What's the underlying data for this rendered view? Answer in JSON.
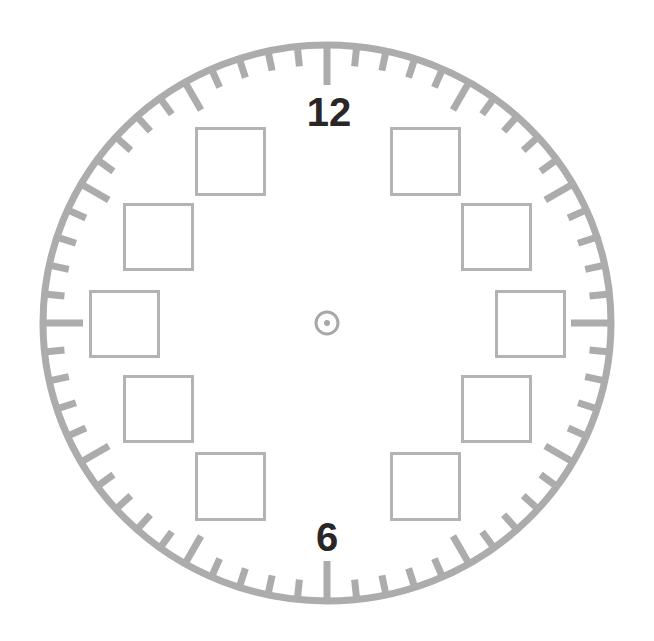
{
  "clock_face": {
    "center": {
      "x": 327,
      "y": 323
    },
    "ring": {
      "rx": 284,
      "ry": 278,
      "stroke_width": 7,
      "color": "#acacac"
    },
    "ticks": {
      "count": 60,
      "color": "#acacac",
      "minor": {
        "length": 20,
        "width": 7
      },
      "five_minute": {
        "length": 32,
        "width": 7
      },
      "quarter": {
        "length": 40,
        "width": 7
      }
    },
    "numerals": [
      {
        "label": "12",
        "x": 329,
        "y": 112,
        "size": 40
      },
      {
        "label": "6",
        "x": 327,
        "y": 537,
        "size": 40
      }
    ],
    "numeral_color": "#2a2526",
    "center_mark": {
      "ring_radius": 11,
      "ring_stroke": 3,
      "dot_radius": 3,
      "color": "#a8a8a8"
    },
    "answer_boxes": [
      {
        "hour": "1",
        "x": 390,
        "y": 127,
        "w": 71,
        "h": 69
      },
      {
        "hour": "2",
        "x": 461,
        "y": 203,
        "w": 71,
        "h": 68
      },
      {
        "hour": "3",
        "x": 495,
        "y": 290,
        "w": 71,
        "h": 68
      },
      {
        "hour": "4",
        "x": 461,
        "y": 375,
        "w": 71,
        "h": 68
      },
      {
        "hour": "5",
        "x": 390,
        "y": 452,
        "w": 71,
        "h": 69
      },
      {
        "hour": "7",
        "x": 195,
        "y": 452,
        "w": 71,
        "h": 69
      },
      {
        "hour": "8",
        "x": 123,
        "y": 375,
        "w": 71,
        "h": 68
      },
      {
        "hour": "9",
        "x": 89,
        "y": 290,
        "w": 71,
        "h": 68
      },
      {
        "hour": "10",
        "x": 123,
        "y": 203,
        "w": 71,
        "h": 68
      },
      {
        "hour": "11",
        "x": 195,
        "y": 127,
        "w": 71,
        "h": 69
      }
    ],
    "box_color": "#b3b3b3"
  }
}
